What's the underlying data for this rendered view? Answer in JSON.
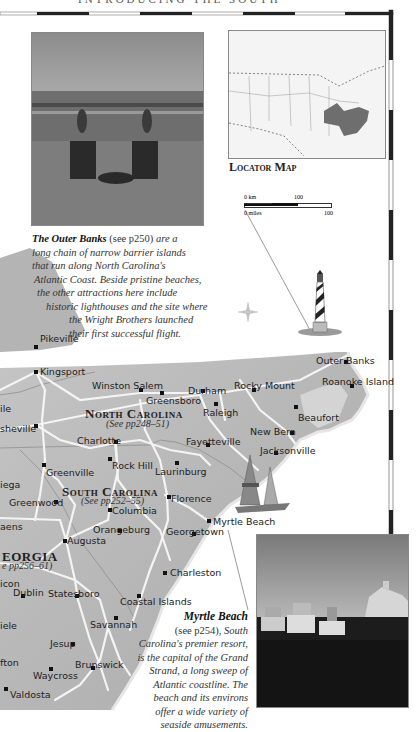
{
  "header": {
    "running_title": "INTRODUCING THE SOUTH"
  },
  "locator_map": {
    "label": "Locator Map",
    "scale": {
      "km_label": "0 km",
      "km_value": "100",
      "miles_label": "0 miles",
      "miles_value": "100"
    }
  },
  "captions": {
    "outer_banks": {
      "title": "The Outer Banks",
      "ref": "(see p250)",
      "text": "are a long chain of narrow barrier islands that run along North Carolina's Atlantic Coast. Beside pristine beaches, the other attractions here include historic lighthouses and the site where the Wright Brothers launched their first successful flight.",
      "lines": [
        "are a",
        "long chain of narrow barrier islands",
        "that run along North Carolina's",
        "Atlantic Coast. Beside pristine beaches,",
        "the other attractions here include",
        "historic lighthouses and the site where",
        "the Wright Brothers launched",
        "their first successful flight."
      ]
    },
    "myrtle_beach": {
      "title": "Myrtle Beach",
      "ref": "(see p254),",
      "lines": [
        "South",
        "Carolina's premier resort,",
        "is the capital of the Grand",
        "Strand, a long sweep of",
        "Atlantic coastline. The",
        "beach and its environs",
        "offer a wide variety of",
        "seaside amusements."
      ]
    }
  },
  "states": {
    "north_carolina": {
      "name": "North Carolina",
      "see": "(See pp248–51)"
    },
    "south_carolina": {
      "name": "South Carolina",
      "see": "(See pp252–55)"
    },
    "georgia": {
      "name": "Georgia",
      "see": "(See pp256–61)",
      "visible_name": "EORGIA",
      "visible_see": "e pp256–61)"
    }
  },
  "cities": {
    "kingsport": "Kingsport",
    "winston_salem": "Winston Salem",
    "greensboro": "Greensboro",
    "durham": "Durham",
    "rocky_mount": "Rocky Mount",
    "raleigh": "Raleigh",
    "outer_banks": "Outer Banks",
    "roanoke_island": "Roanoke Island",
    "beaufort": "Beaufort",
    "new_bern": "New Bern",
    "jacksonville": "Jacksonville",
    "fayetteville": "Fayetteville",
    "charlotte": "Charlotte",
    "rock_hill": "Rock Hill",
    "laurinburg": "Laurinburg",
    "asheville": "Asheville",
    "asheville_visible": "sheville",
    "greenville": "Greenville",
    "pikeville": "Pikeville",
    "knoxville_visible": "ile",
    "toccoa_visible": "iega",
    "greenwood": "Greenwood",
    "athens_visible": "aens",
    "columbia": "Columbia",
    "florence": "Florence",
    "myrtle_beach": "Myrtle Beach",
    "orangeburg": "Orangeburg",
    "georgetown": "Georgetown",
    "augusta": "Augusta",
    "charleston": "Charleston",
    "macon_visible": "icon",
    "dublin": "Dublin",
    "statesboro": "Statesboro",
    "coastal_islands": "Coastal Islands",
    "savannah": "Savannah",
    "jesup": "Jesup",
    "brunswick": "Brunswick",
    "waycross": "Waycross",
    "tifton_visible": "fton",
    "valdosta": "Valdosta",
    "eastman_visible": "iele"
  },
  "colors": {
    "land": "#b9b9b9",
    "sea": "#ffffff",
    "road": "#f2f2f2",
    "highlight": "#6e6e6e"
  }
}
